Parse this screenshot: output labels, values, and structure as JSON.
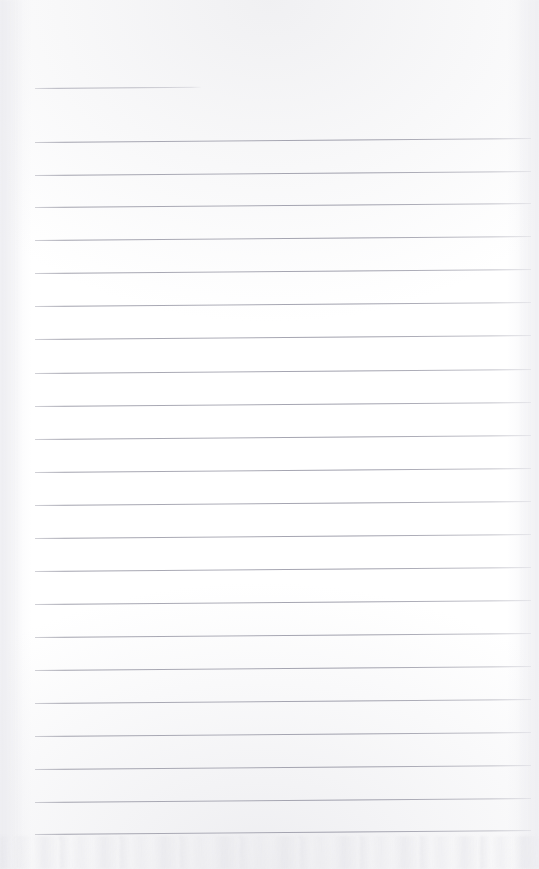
{
  "document": {
    "type": "scanned-lined-notebook-page",
    "title": "",
    "page_width": 539,
    "page_height": 869,
    "background_color": "#ffffff",
    "paper_tone_color": "#fdfdfd",
    "text_content": "",
    "handwriting_present": false,
    "printed_text_present": false
  },
  "ruling": {
    "line_color": "#a4a4b0",
    "line_thickness_px": 1,
    "line_spacing_px": 33,
    "left_margin_px": 35,
    "right_edge_px": 530,
    "tilt_rise_px": -4,
    "header_rule": {
      "label": "header-rule",
      "x": 35,
      "y": 88,
      "width": 166
    },
    "body_rules": [
      {
        "index": 1,
        "x": 35,
        "y": 142,
        "width": 496
      },
      {
        "index": 2,
        "x": 35,
        "y": 175,
        "width": 496
      },
      {
        "index": 3,
        "x": 35,
        "y": 207,
        "width": 496
      },
      {
        "index": 4,
        "x": 35,
        "y": 240,
        "width": 496
      },
      {
        "index": 5,
        "x": 35,
        "y": 273,
        "width": 496
      },
      {
        "index": 6,
        "x": 35,
        "y": 306,
        "width": 496
      },
      {
        "index": 7,
        "x": 35,
        "y": 339,
        "width": 496
      },
      {
        "index": 8,
        "x": 35,
        "y": 373,
        "width": 496
      },
      {
        "index": 9,
        "x": 35,
        "y": 406,
        "width": 496
      },
      {
        "index": 10,
        "x": 35,
        "y": 439,
        "width": 496
      },
      {
        "index": 11,
        "x": 35,
        "y": 472,
        "width": 496
      },
      {
        "index": 12,
        "x": 35,
        "y": 505,
        "width": 496
      },
      {
        "index": 13,
        "x": 35,
        "y": 538,
        "width": 496
      },
      {
        "index": 14,
        "x": 35,
        "y": 571,
        "width": 496
      },
      {
        "index": 15,
        "x": 35,
        "y": 604,
        "width": 496
      },
      {
        "index": 16,
        "x": 35,
        "y": 637,
        "width": 496
      },
      {
        "index": 17,
        "x": 35,
        "y": 670,
        "width": 496
      },
      {
        "index": 18,
        "x": 35,
        "y": 703,
        "width": 496
      },
      {
        "index": 19,
        "x": 35,
        "y": 736,
        "width": 496
      },
      {
        "index": 20,
        "x": 35,
        "y": 769,
        "width": 496
      },
      {
        "index": 21,
        "x": 35,
        "y": 802,
        "width": 496
      },
      {
        "index": 22,
        "x": 35,
        "y": 834,
        "width": 496
      }
    ]
  },
  "scan_artifacts": {
    "top_band_label": "scan-noise-top",
    "bottom_band_label": "scan-noise-bottom",
    "left_edge_label": "scan-noise-left",
    "right_edge_label": "scan-noise-right",
    "artifact_color": "#e6e6ea"
  }
}
